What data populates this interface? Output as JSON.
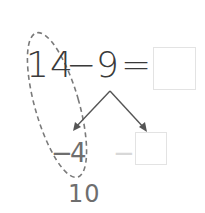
{
  "equation": {
    "minuend": "14",
    "operator": "−",
    "subtrahend": "9",
    "equals": "=",
    "answer": ""
  },
  "decomposition": {
    "left_operator": "−",
    "left_value": "4",
    "right_operator": "−",
    "right_value": ""
  },
  "intermediate_result": "10",
  "colors": {
    "main_text": "#3a3a3a",
    "sub_text": "#6e6e6e",
    "faded": "#d8d8d8",
    "arrow": "#555555",
    "dash": "#7a7a7a",
    "box_border": "#e3e3e3"
  }
}
